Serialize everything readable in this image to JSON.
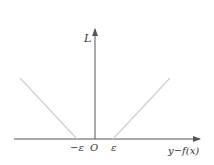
{
  "diagram": {
    "type": "epsilon-insensitive loss function plot",
    "y_axis_label": "L",
    "x_axis_label": "y−f(x)",
    "tick_labels": {
      "neg_epsilon": "−ε",
      "origin": "O",
      "pos_epsilon": "ε"
    },
    "colors": {
      "axis": "#555555",
      "loss_line": "#cfcfcf",
      "text": "#333333"
    }
  }
}
